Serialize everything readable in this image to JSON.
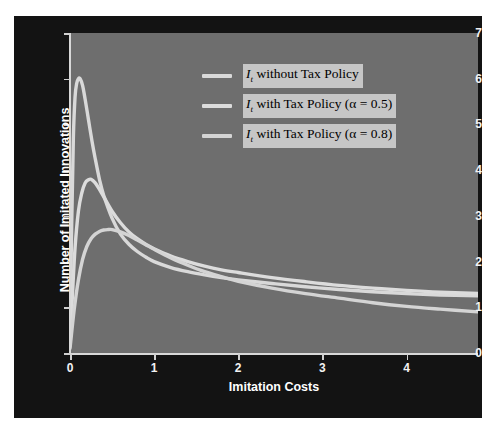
{
  "figure": {
    "header_faint_text": "",
    "background_color": "#131313",
    "plot_background_color": "#6e6e6e",
    "curve_color": "#d9d9d9",
    "axis_color": "#d8d8d8",
    "text_color": "#ffffff",
    "legend_label_background": "#c6c6c6"
  },
  "chart_data": {
    "type": "line",
    "title": "",
    "xlabel": "Imitation Costs",
    "ylabel": "Number of Imitated Innovations",
    "xlim": [
      0,
      4.85
    ],
    "ylim": [
      0,
      7
    ],
    "xticks": [
      0,
      1,
      2,
      3,
      4
    ],
    "yticks": [
      0,
      1,
      2,
      3,
      4,
      5,
      6,
      7
    ],
    "grid": false,
    "legend_position": "upper right",
    "series": [
      {
        "name": "I_t without Tax Policy",
        "label_prefix": "I",
        "label_subscript": "t",
        "label_rest": " without Tax Policy",
        "color": "#d9d9d9",
        "peak_x": 0.12,
        "peak_y": 6.0,
        "end_y": 1.25,
        "x": [
          0.0,
          0.02,
          0.04,
          0.06,
          0.08,
          0.1,
          0.12,
          0.15,
          0.18,
          0.22,
          0.26,
          0.3,
          0.35,
          0.4,
          0.5,
          0.6,
          0.7,
          0.8,
          0.9,
          1.0,
          1.2,
          1.4,
          1.6,
          1.8,
          2.0,
          2.4,
          2.8,
          3.2,
          3.6,
          4.0,
          4.4,
          4.85
        ],
        "y": [
          0.3,
          2.8,
          4.7,
          5.6,
          5.9,
          6.0,
          6.0,
          5.85,
          5.55,
          5.1,
          4.65,
          4.25,
          3.8,
          3.45,
          2.95,
          2.6,
          2.38,
          2.22,
          2.1,
          2.0,
          1.87,
          1.78,
          1.71,
          1.65,
          1.6,
          1.52,
          1.45,
          1.39,
          1.34,
          1.3,
          1.27,
          1.25
        ]
      },
      {
        "name": "I_t with Tax Policy (alpha = 0.5)",
        "label_prefix": "I",
        "label_subscript": "t",
        "label_rest": " with Tax Policy (α = 0.5)",
        "color": "#dcdcdc",
        "alpha": 0.5,
        "peak_x": 0.25,
        "peak_y": 3.8,
        "end_y": 1.3,
        "x": [
          0.0,
          0.03,
          0.06,
          0.1,
          0.14,
          0.18,
          0.22,
          0.25,
          0.3,
          0.35,
          0.4,
          0.5,
          0.6,
          0.7,
          0.8,
          0.9,
          1.0,
          1.2,
          1.4,
          1.6,
          1.8,
          2.0,
          2.4,
          2.8,
          3.2,
          3.6,
          4.0,
          4.4,
          4.85
        ],
        "y": [
          0.15,
          1.3,
          2.3,
          3.1,
          3.5,
          3.72,
          3.79,
          3.8,
          3.72,
          3.58,
          3.42,
          3.1,
          2.85,
          2.65,
          2.5,
          2.38,
          2.28,
          2.12,
          2.0,
          1.9,
          1.82,
          1.76,
          1.65,
          1.56,
          1.48,
          1.42,
          1.37,
          1.33,
          1.3
        ]
      },
      {
        "name": "I_t with Tax Policy (alpha = 0.8)",
        "label_prefix": "I",
        "label_subscript": "t",
        "label_rest": " with Tax Policy (α = 0.8)",
        "color": "#d4d4d4",
        "alpha": 0.8,
        "peak_x": 0.5,
        "peak_y": 2.7,
        "end_y": 0.9,
        "x": [
          0.0,
          0.05,
          0.1,
          0.15,
          0.2,
          0.25,
          0.3,
          0.35,
          0.4,
          0.45,
          0.5,
          0.6,
          0.7,
          0.8,
          0.9,
          1.0,
          1.2,
          1.4,
          1.6,
          1.8,
          2.0,
          2.4,
          2.8,
          3.2,
          3.6,
          4.0,
          4.4,
          4.85
        ],
        "y": [
          0.1,
          0.95,
          1.6,
          2.05,
          2.33,
          2.5,
          2.6,
          2.66,
          2.69,
          2.7,
          2.7,
          2.65,
          2.57,
          2.47,
          2.37,
          2.27,
          2.08,
          1.92,
          1.78,
          1.67,
          1.57,
          1.42,
          1.3,
          1.2,
          1.1,
          1.02,
          0.96,
          0.9
        ]
      }
    ]
  },
  "axes": {
    "y_tick_labels": [
      "0",
      "1",
      "2",
      "3",
      "4",
      "5",
      "6",
      "7"
    ],
    "x_tick_labels": [
      "0",
      "1",
      "2",
      "3",
      "4"
    ]
  }
}
